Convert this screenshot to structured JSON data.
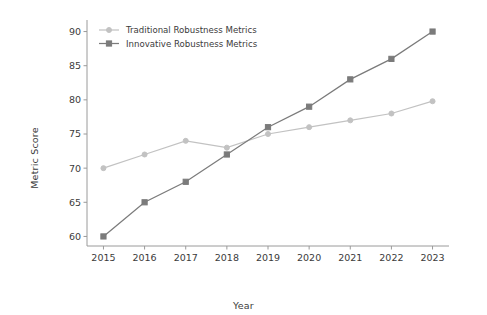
{
  "chart_data": {
    "type": "line",
    "title": "",
    "xlabel": "Year",
    "ylabel": "Metric Score",
    "categories": [
      2015,
      2016,
      2017,
      2018,
      2019,
      2020,
      2021,
      2022,
      2023
    ],
    "x_tick_labels": [
      "2015",
      "2016",
      "2017",
      "2018",
      "2019",
      "2020",
      "2021",
      "2022",
      "2023"
    ],
    "y_tick_labels": [
      "60",
      "65",
      "70",
      "75",
      "80",
      "85",
      "90"
    ],
    "y_ticks": [
      60,
      65,
      70,
      75,
      80,
      85,
      90
    ],
    "xlim": [
      2014.6,
      2023.4
    ],
    "ylim": [
      58.6,
      91.4
    ],
    "grid": false,
    "legend_position": "upper left",
    "series": [
      {
        "name": "Traditional Robustness Metrics",
        "values": [
          70,
          72,
          74,
          73,
          75,
          76,
          77,
          78,
          79.8
        ],
        "color": "#c2c2c2",
        "marker": "circle"
      },
      {
        "name": "Innovative Robustness Metrics",
        "values": [
          60,
          65,
          68,
          72,
          76,
          79,
          83,
          86,
          90
        ],
        "color": "#7b7b7b",
        "marker": "square"
      }
    ]
  },
  "axes": {
    "spine_color": "#9a9a9a",
    "background": "#ffffff"
  }
}
